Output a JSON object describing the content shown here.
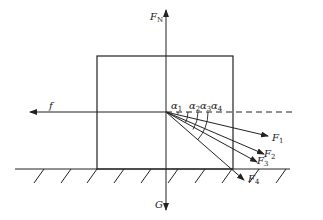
{
  "diagram": {
    "forces": {
      "normal": {
        "symbol": "F",
        "subscript": "N"
      },
      "gravity": {
        "symbol": "G"
      },
      "friction": {
        "symbol": "f"
      },
      "applied": [
        {
          "symbol": "F",
          "subscript": "1"
        },
        {
          "symbol": "F",
          "subscript": "2"
        },
        {
          "symbol": "F",
          "subscript": "3"
        },
        {
          "symbol": "F",
          "subscript": "4"
        }
      ]
    },
    "angles": [
      {
        "symbol": "α",
        "subscript": "1"
      },
      {
        "symbol": "α",
        "subscript": "2"
      },
      {
        "symbol": "α",
        "subscript": "3"
      },
      {
        "symbol": "α",
        "subscript": "4"
      }
    ],
    "colors": {
      "line": "#222222",
      "background": "#ffffff"
    }
  }
}
